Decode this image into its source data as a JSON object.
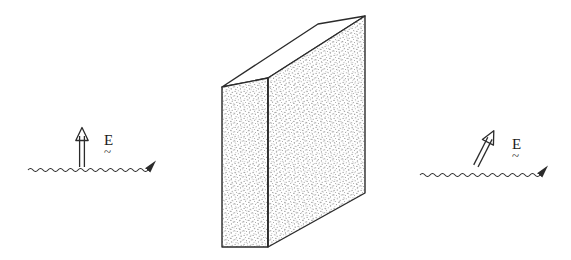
{
  "figure": {
    "kind": "physics-diagram",
    "caption_visible": "",
    "background_color": "#ffffff",
    "ink_color": "#2b2b2b",
    "stipple_color": "#8c8c8c"
  },
  "slab": {
    "name": "dielectric-slab",
    "front_face_fill": "stipple",
    "side_face_fill": "stipple",
    "top_face_fill": "white",
    "geometry": {
      "front_top_left": [
        268,
        78
      ],
      "front_top_right": [
        365,
        16
      ],
      "front_bottom_right": [
        365,
        193
      ],
      "front_bottom_left": [
        268,
        247
      ],
      "side_top_left": [
        222,
        87
      ],
      "side_bottom_left": [
        222,
        247
      ],
      "top_back_left": [
        222,
        87
      ],
      "top_back_right": [
        318,
        24
      ]
    }
  },
  "left_beam": {
    "name": "incident-wave",
    "wave_label": "",
    "wave_start_x": 28,
    "wave_end_x": 148,
    "wave_y": 170,
    "arrow_tip_x": 163,
    "field_arrow": {
      "type": "vertical",
      "angle_deg": 0,
      "base": [
        82,
        167
      ],
      "tip": [
        82,
        128
      ]
    },
    "field_label": "E",
    "field_label_accent": "~"
  },
  "right_beam": {
    "name": "transmitted-wave",
    "wave_label": "",
    "wave_start_x": 420,
    "wave_end_x": 542,
    "wave_y": 175,
    "arrow_tip_x": 557,
    "field_arrow": {
      "type": "tilted",
      "angle_deg": 30,
      "base": [
        472,
        168
      ],
      "tip": [
        497,
        130
      ]
    },
    "field_label": "E",
    "field_label_accent": "~"
  }
}
